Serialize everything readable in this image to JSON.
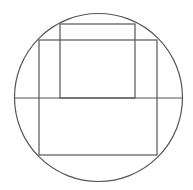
{
  "diagram": {
    "stroke_color": "#555555",
    "background": "#ffffff",
    "circle": {
      "cx": 98.5,
      "cy": 97.5,
      "r": 84
    },
    "diameter": {
      "x1": 14.5,
      "y1": 98,
      "x2": 182.5,
      "y2": 98
    },
    "outer_rect": {
      "x": 39,
      "y": 40,
      "width": 118,
      "height": 115
    },
    "inner_rect": {
      "x": 60,
      "y": 24,
      "width": 75,
      "height": 74
    }
  }
}
